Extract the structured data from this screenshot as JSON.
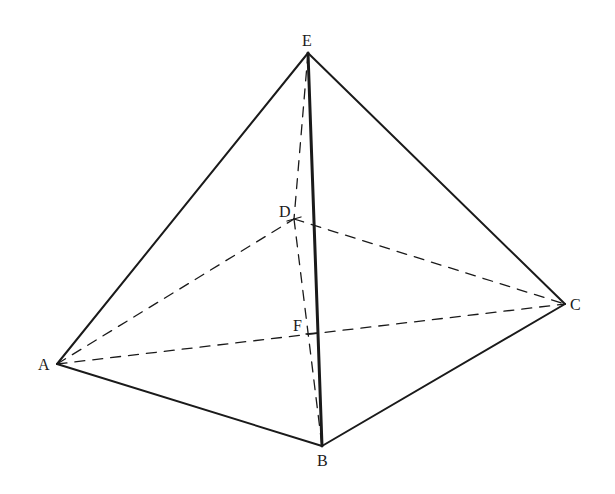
{
  "diagram": {
    "type": "pyramid",
    "colors": {
      "line": "#1a1a1a",
      "background": "#ffffff"
    },
    "points": {
      "E": {
        "label": "E",
        "x": 308,
        "y": 53
      },
      "D": {
        "label": "D",
        "x": 294,
        "y": 219
      },
      "F": {
        "label": "F",
        "x": 312,
        "y": 333
      },
      "A": {
        "label": "A",
        "x": 57,
        "y": 364
      },
      "B": {
        "label": "B",
        "x": 322,
        "y": 446
      },
      "C": {
        "label": "C",
        "x": 565,
        "y": 304
      }
    },
    "solid_edges": [
      "EA",
      "EB",
      "EC",
      "AB",
      "BC"
    ],
    "dashed_edges": [
      "ED",
      "AD",
      "DC",
      "AC",
      "DB"
    ]
  }
}
